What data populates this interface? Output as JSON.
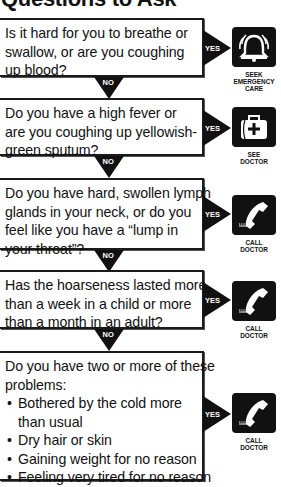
{
  "header": {
    "title": "Questions to Ask"
  },
  "connectors": {
    "no_label": "NO",
    "yes_label": "YES"
  },
  "questions": [
    {
      "lines": [
        "Is it hard for you to breathe or",
        "swallow, or are you coughing",
        "up blood?"
      ],
      "action": {
        "icon": "bell-alarm-icon",
        "label_lines": [
          "SEEK",
          "EMERGENCY",
          "CARE"
        ]
      }
    },
    {
      "lines": [
        "Do you have a high fever or",
        "are you coughing up yellowish-",
        "green sputum?"
      ],
      "action": {
        "icon": "medical-bag-icon",
        "label_lines": [
          "SEE",
          "DOCTOR"
        ]
      }
    },
    {
      "lines": [
        "Do you have hard, swollen lymph",
        "glands in your neck, or do you",
        "feel like you have a “lump in",
        "your throat”?"
      ],
      "action": {
        "icon": "phone-icon",
        "label_lines": [
          "CALL",
          "DOCTOR"
        ]
      }
    },
    {
      "lines": [
        "Has the hoarseness lasted more",
        "than a week in a child or more",
        "than a month in an adult?"
      ],
      "action": {
        "icon": "phone-icon",
        "label_lines": [
          "CALL",
          "DOCTOR"
        ]
      }
    },
    {
      "lines": [
        "Do you have two or more of these",
        "problems:"
      ],
      "bullets": [
        [
          "Bothered by the cold more",
          "than usual"
        ],
        [
          "Dry hair or skin"
        ],
        [
          "Gaining weight for no reason"
        ],
        [
          "Feeling very tired for no reason"
        ]
      ],
      "action": {
        "icon": "phone-icon",
        "label_lines": [
          "CALL",
          "DOCTOR"
        ]
      }
    }
  ]
}
